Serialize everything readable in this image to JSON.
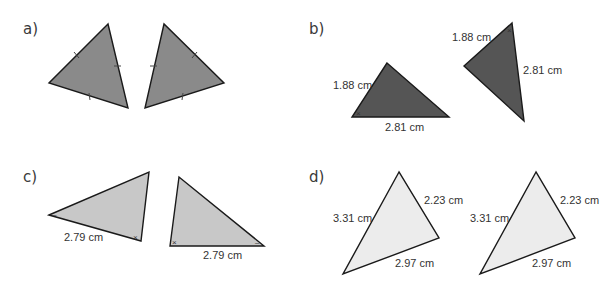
{
  "panels": [
    {
      "id": "a",
      "label": "a)",
      "fill": "#8a8a8a",
      "triangles": [
        {
          "side_labels": [],
          "tick_marks": 3
        },
        {
          "side_labels": [],
          "tick_marks": 3
        }
      ]
    },
    {
      "id": "b",
      "label": "b)",
      "fill": "#555555",
      "triangles": [
        {
          "side_labels": [
            "1.88 cm",
            "2.81 cm"
          ],
          "angle_mark": "×"
        },
        {
          "side_labels": [
            "1.88 cm",
            "2.81 cm"
          ],
          "angle_mark": "×"
        }
      ]
    },
    {
      "id": "c",
      "label": "c)",
      "fill": "#c8c8c8",
      "triangles": [
        {
          "side_labels": [
            "2.79 cm"
          ],
          "angle_marks": [
            "–",
            "×"
          ]
        },
        {
          "side_labels": [
            "2.79 cm"
          ],
          "angle_marks": [
            "×",
            "–"
          ]
        }
      ]
    },
    {
      "id": "d",
      "label": "d)",
      "fill": "#ececec",
      "triangles": [
        {
          "side_labels": [
            "3.31 cm",
            "2.23 cm",
            "2.97 cm"
          ]
        },
        {
          "side_labels": [
            "3.31 cm",
            "2.23 cm",
            "2.97 cm"
          ]
        }
      ]
    }
  ]
}
